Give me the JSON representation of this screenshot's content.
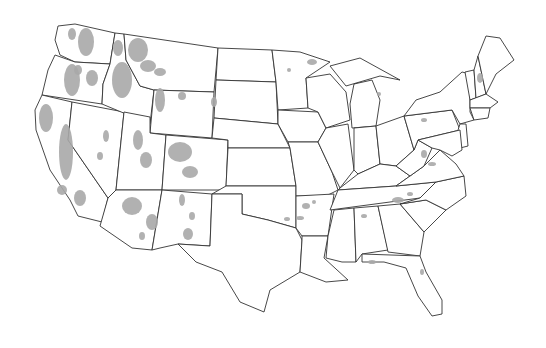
{
  "map": {
    "subject": "Contiguous United States",
    "style": "state outline map with gray shaded regions",
    "colors": {
      "outline": "#333333",
      "shade": "#a8a8a8",
      "background": "#ffffff"
    },
    "shaded_regions": [
      "Washington Cascades",
      "Oregon Cascades",
      "Northern Idaho",
      "Western Montana",
      "Sierra Nevada (California)",
      "Northern California coast ranges",
      "Utah mountains",
      "Colorado Rockies",
      "Arizona (Mogollon Rim)",
      "New Mexico mountains",
      "Wyoming",
      "Arkansas (Ozarks)",
      "Southern Appalachians",
      "Florida"
    ]
  }
}
